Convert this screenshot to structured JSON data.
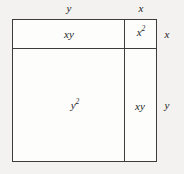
{
  "diagram": {
    "name": "area-model-square-of-binomial",
    "identity": "(x + y)^2 = x^2 + 2xy + y^2",
    "background_color": "#f3f2f0",
    "fill_color": "#fdfdfc",
    "line_color": "#3c3c3c",
    "cells": {
      "top_left": {
        "base": "xy",
        "exponent": ""
      },
      "top_right": {
        "base": "x",
        "exponent": "2"
      },
      "bottom_left": {
        "base": "y",
        "exponent": "2"
      },
      "bottom_right": {
        "base": "xy",
        "exponent": ""
      }
    },
    "dimensions": {
      "top_left_width": "y",
      "top_right_width": "x",
      "right_top_height": "x",
      "right_bottom_height": "y"
    }
  },
  "chart_data": {
    "type": "area-model",
    "title": "",
    "xlabel": "",
    "ylabel": "",
    "column_labels": [
      "y",
      "x"
    ],
    "row_labels": [
      "x",
      "y"
    ],
    "column_widths": [
      112,
      33
    ],
    "row_heights": [
      29,
      113
    ],
    "cell_terms": [
      [
        "xy",
        "x²"
      ],
      [
        "y²",
        "xy"
      ]
    ],
    "grid": true,
    "legend": "none"
  }
}
